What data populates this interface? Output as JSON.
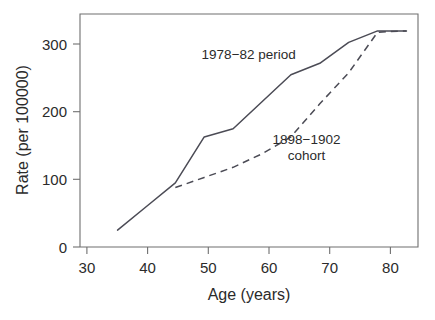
{
  "chart_data": {
    "type": "line",
    "title": "",
    "xlabel": "Age (years)",
    "ylabel": "Rate (per 100000)",
    "xlim": [
      26,
      84.5
    ],
    "ylim": [
      0,
      345
    ],
    "xticks": [
      30,
      40,
      50,
      60,
      70,
      80
    ],
    "xtick_labels": [
      "30",
      "40",
      "50",
      "60",
      "70",
      "80"
    ],
    "yticks": [
      0,
      100,
      200,
      300
    ],
    "ytick_labels": [
      "0",
      "100",
      "200",
      "300"
    ],
    "grid": false,
    "legend_position": "inline-annotation",
    "series": [
      {
        "name": "1978-82 period",
        "style": "solid",
        "color": "#4b4b55",
        "x": [
          32.5,
          37.5,
          42.5,
          47.5,
          52.5,
          57.5,
          62.5,
          67.5,
          72.5,
          77.5,
          82.5
        ],
        "y": [
          25,
          60,
          95,
          163,
          175,
          215,
          255,
          272,
          303,
          320,
          320
        ]
      },
      {
        "name": "1898-1902 cohort",
        "style": "dashed",
        "color": "#4b4b55",
        "x": [
          42.5,
          47.5,
          52.5,
          57.5,
          62.5,
          67.5,
          72.5,
          77.5,
          82.5
        ],
        "y": [
          88,
          103,
          118,
          138,
          163,
          212,
          258,
          318,
          320
        ]
      }
    ],
    "annotations": [
      {
        "id": "period-annotation",
        "text": "1978−82 period",
        "x": 55.2,
        "y": 278,
        "anchor": "middle",
        "lines": [
          "1978−82 period"
        ]
      },
      {
        "id": "cohort-annotation",
        "text": "1898−1902 cohort",
        "x": 65.2,
        "y": 152,
        "anchor": "middle",
        "lines": [
          "1898−1902",
          "cohort"
        ]
      }
    ]
  },
  "caption": {
    "cut_off_text": ""
  }
}
